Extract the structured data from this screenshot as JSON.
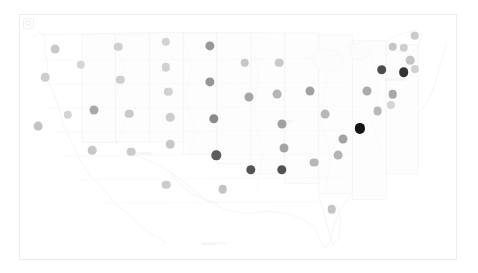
{
  "map": {
    "title": "United States state value map",
    "projection": "albers-usa",
    "frame": {
      "x": 19,
      "y": 14,
      "width": 438,
      "height": 246
    },
    "background_color": "#ffffff",
    "border_color": "#ececec",
    "state_fill_color": "#fdfdfd",
    "state_stroke_color": "#f0f0f0",
    "zoom_control": {
      "name": "zoom-control",
      "icon": "magnifier-icon"
    },
    "basemap_labels": [
      {
        "text": "KANSAS CITY",
        "x": 44.5,
        "y": 93
      },
      {
        "text": "DENVER",
        "x": 28.5,
        "y": 56
      },
      {
        "text": "CHICAGO",
        "x": 60.5,
        "y": 43
      },
      {
        "text": "NEW YORK",
        "x": 86.0,
        "y": 26
      }
    ]
  },
  "legend": {
    "title": "Value",
    "low_label": "Low",
    "high_label": "High",
    "low_color": "#ebebeb",
    "high_color": "#1a1a1a"
  },
  "chart_data": {
    "type": "map",
    "value_range": [
      0,
      100
    ],
    "color_scale": {
      "low": "#ebebeb",
      "high": "#1a1a1a"
    },
    "points": [
      {
        "state": "Washington",
        "x": 8.0,
        "y": 14.0,
        "r": 4.4,
        "value": 26,
        "color": "#c9c9c9"
      },
      {
        "state": "Oregon",
        "x": 5.8,
        "y": 25.5,
        "r": 4.3,
        "value": 24,
        "color": "#cdcdcd"
      },
      {
        "state": "California",
        "x": 4.2,
        "y": 45.5,
        "r": 4.4,
        "value": 30,
        "color": "#c3c3c3"
      },
      {
        "state": "Nevada",
        "x": 11.0,
        "y": 41.0,
        "r": 4.2,
        "value": 21,
        "color": "#d3d3d3"
      },
      {
        "state": "Idaho",
        "x": 14.0,
        "y": 20.5,
        "r": 4.2,
        "value": 20,
        "color": "#d5d5d5"
      },
      {
        "state": "Montana",
        "x": 22.5,
        "y": 13.0,
        "r": 4.3,
        "value": 22,
        "color": "#d0d0d0"
      },
      {
        "state": "Wyoming",
        "x": 23.0,
        "y": 26.5,
        "r": 4.2,
        "value": 23,
        "color": "#cecece"
      },
      {
        "state": "Utah",
        "x": 17.0,
        "y": 39.0,
        "r": 4.5,
        "value": 40,
        "color": "#a8a8a8"
      },
      {
        "state": "Arizona",
        "x": 16.5,
        "y": 55.5,
        "r": 4.3,
        "value": 27,
        "color": "#c7c7c7"
      },
      {
        "state": "Colorado",
        "x": 25.0,
        "y": 40.5,
        "r": 4.3,
        "value": 26,
        "color": "#c9c9c9"
      },
      {
        "state": "New Mexico",
        "x": 25.5,
        "y": 56.0,
        "r": 4.3,
        "value": 25,
        "color": "#cbcbcb"
      },
      {
        "state": "North Dakota",
        "x": 33.5,
        "y": 11.0,
        "r": 4.2,
        "value": 21,
        "color": "#d3d3d3"
      },
      {
        "state": "South Dakota",
        "x": 33.5,
        "y": 21.5,
        "r": 4.2,
        "value": 22,
        "color": "#d1d1d1"
      },
      {
        "state": "Nebraska",
        "x": 34.0,
        "y": 31.5,
        "r": 4.2,
        "value": 22,
        "color": "#d1d1d1"
      },
      {
        "state": "Kansas",
        "x": 34.5,
        "y": 42.0,
        "r": 4.3,
        "value": 24,
        "color": "#cdcdcd"
      },
      {
        "state": "Oklahoma",
        "x": 34.5,
        "y": 53.0,
        "r": 4.3,
        "value": 26,
        "color": "#c9c9c9"
      },
      {
        "state": "Texas",
        "x": 33.5,
        "y": 69.5,
        "r": 4.3,
        "value": 25,
        "color": "#cbcbcb"
      },
      {
        "state": "Minnesota",
        "x": 43.5,
        "y": 12.5,
        "r": 4.6,
        "value": 48,
        "color": "#989898"
      },
      {
        "state": "Iowa",
        "x": 43.5,
        "y": 27.5,
        "r": 4.6,
        "value": 49,
        "color": "#969696"
      },
      {
        "state": "Missouri",
        "x": 44.5,
        "y": 42.5,
        "r": 4.7,
        "value": 55,
        "color": "#8a8a8a"
      },
      {
        "state": "Arkansas",
        "x": 45.0,
        "y": 57.5,
        "r": 4.7,
        "value": 70,
        "color": "#5c5c5c"
      },
      {
        "state": "Louisiana",
        "x": 46.5,
        "y": 71.5,
        "r": 4.3,
        "value": 30,
        "color": "#c3c3c3"
      },
      {
        "state": "Wisconsin",
        "x": 51.5,
        "y": 19.5,
        "r": 4.3,
        "value": 27,
        "color": "#c7c7c7"
      },
      {
        "state": "Illinois",
        "x": 52.5,
        "y": 33.5,
        "r": 4.5,
        "value": 41,
        "color": "#a6a6a6"
      },
      {
        "state": "Mississippi",
        "x": 53.0,
        "y": 63.5,
        "r": 4.7,
        "value": 72,
        "color": "#545454"
      },
      {
        "state": "Michigan",
        "x": 59.5,
        "y": 19.5,
        "r": 4.3,
        "value": 26,
        "color": "#c9c9c9"
      },
      {
        "state": "Indiana",
        "x": 59.0,
        "y": 32.5,
        "r": 4.4,
        "value": 35,
        "color": "#b5b5b5"
      },
      {
        "state": "Kentucky",
        "x": 60.0,
        "y": 44.5,
        "r": 4.5,
        "value": 44,
        "color": "#a1a1a1"
      },
      {
        "state": "Tennessee",
        "x": 60.5,
        "y": 54.5,
        "r": 4.5,
        "value": 42,
        "color": "#a4a4a4"
      },
      {
        "state": "Alabama",
        "x": 60.0,
        "y": 63.5,
        "r": 4.7,
        "value": 73,
        "color": "#525252"
      },
      {
        "state": "Ohio",
        "x": 66.5,
        "y": 31.0,
        "r": 4.5,
        "value": 44,
        "color": "#a1a1a1"
      },
      {
        "state": "West Virginia",
        "x": 70.0,
        "y": 40.5,
        "r": 4.4,
        "value": 34,
        "color": "#b7b7b7"
      },
      {
        "state": "Georgia",
        "x": 67.5,
        "y": 60.5,
        "r": 4.4,
        "value": 34,
        "color": "#b7b7b7"
      },
      {
        "state": "Florida",
        "x": 71.5,
        "y": 79.5,
        "r": 4.3,
        "value": 28,
        "color": "#c5c5c5"
      },
      {
        "state": "North Carolina",
        "x": 74.0,
        "y": 51.0,
        "r": 4.5,
        "value": 43,
        "color": "#a3a3a3"
      },
      {
        "state": "South Carolina",
        "x": 73.0,
        "y": 57.5,
        "r": 4.4,
        "value": 36,
        "color": "#b3b3b3"
      },
      {
        "state": "Virginia",
        "x": 78.0,
        "y": 46.5,
        "r": 5.1,
        "value": 96,
        "color": "#141414"
      },
      {
        "state": "Pennsylvania",
        "x": 79.5,
        "y": 31.0,
        "r": 4.5,
        "value": 39,
        "color": "#aaaaaa"
      },
      {
        "state": "Maryland",
        "x": 82.0,
        "y": 39.5,
        "r": 4.4,
        "value": 33,
        "color": "#b9b9b9"
      },
      {
        "state": "Delaware",
        "x": 85.0,
        "y": 37.0,
        "r": 4.1,
        "value": 20,
        "color": "#d5d5d5"
      },
      {
        "state": "New Jersey",
        "x": 85.5,
        "y": 32.5,
        "r": 4.3,
        "value": 40,
        "color": "#a8a8a8"
      },
      {
        "state": "New York",
        "x": 83.0,
        "y": 22.5,
        "r": 4.8,
        "value": 76,
        "color": "#4d4d4d"
      },
      {
        "state": "Connecticut",
        "x": 88.0,
        "y": 23.5,
        "r": 4.8,
        "value": 86,
        "color": "#333333"
      },
      {
        "state": "Rhode Island",
        "x": 90.5,
        "y": 22.0,
        "r": 4.1,
        "value": 22,
        "color": "#d1d1d1"
      },
      {
        "state": "Massachusetts",
        "x": 89.5,
        "y": 18.5,
        "r": 4.3,
        "value": 29,
        "color": "#c5c5c5"
      },
      {
        "state": "Vermont",
        "x": 85.5,
        "y": 13.0,
        "r": 4.3,
        "value": 28,
        "color": "#c6c6c6"
      },
      {
        "state": "New Hampshire",
        "x": 88.0,
        "y": 13.5,
        "r": 4.2,
        "value": 23,
        "color": "#cfcfcf"
      },
      {
        "state": "Maine",
        "x": 90.5,
        "y": 8.5,
        "r": 4.3,
        "value": 26,
        "color": "#cacaca"
      }
    ]
  }
}
